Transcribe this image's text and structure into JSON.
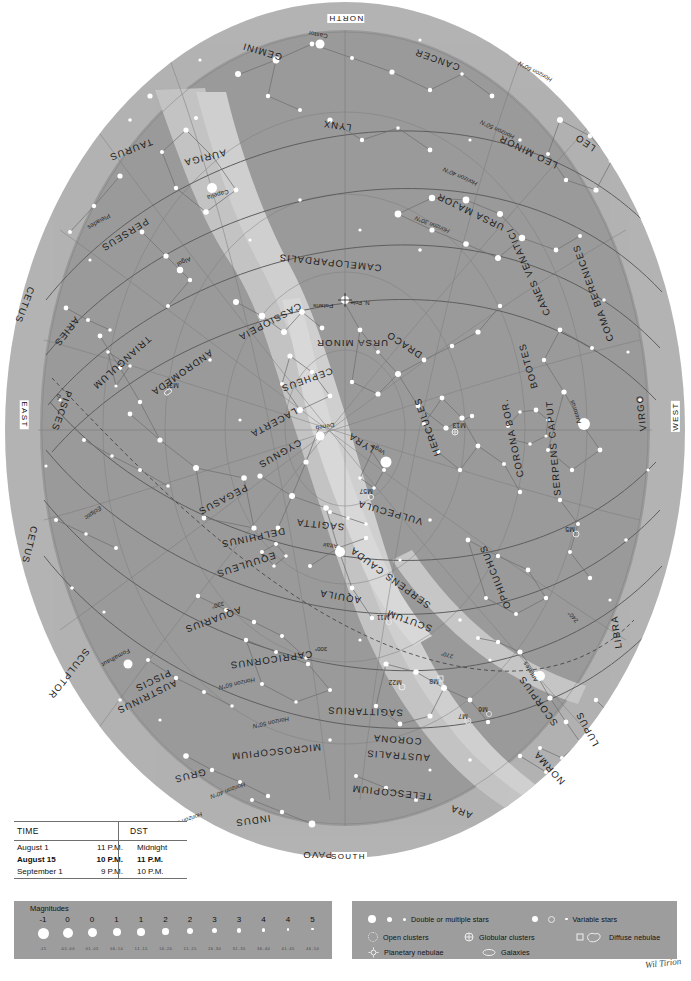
{
  "chart": {
    "cardinals": {
      "north": "NORTH",
      "south": "SOUTH",
      "east": "EAST",
      "west": "WEST"
    },
    "pole_label": "N. Pole",
    "colors": {
      "sky": "#9a9a9a",
      "sky_outer": "#b0b0b0",
      "milky_way": "#c4c4c4",
      "milky_way_bright": "#d2d2d2",
      "page": "#ffffff",
      "star": "#ffffff",
      "line": "#6a6a6a",
      "legend_panel": "#9d9d9d",
      "text": "#1c1c1c"
    },
    "constellations": [
      {
        "name": "GEMINI",
        "x": 262,
        "y": 52,
        "rot": 196,
        "size": "big"
      },
      {
        "name": "CANCER",
        "x": 437,
        "y": 60,
        "rot": 200,
        "size": "big"
      },
      {
        "name": "LYNX",
        "x": 337,
        "y": 126,
        "rot": 188,
        "size": "big"
      },
      {
        "name": "LEO",
        "x": 585,
        "y": 143,
        "rot": 214,
        "size": "big"
      },
      {
        "name": "LEO MINOR",
        "x": 528,
        "y": 152,
        "rot": 206,
        "size": "big"
      },
      {
        "name": "AURIGA",
        "x": 205,
        "y": 158,
        "rot": 166,
        "size": "big"
      },
      {
        "name": "TAURUS",
        "x": 131,
        "y": 150,
        "rot": 159,
        "size": "big"
      },
      {
        "name": "URSA MAJOR",
        "x": 470,
        "y": 212,
        "rot": 206,
        "size": "big"
      },
      {
        "name": "PERSEUS",
        "x": 125,
        "y": 235,
        "rot": 148,
        "size": "big"
      },
      {
        "name": "CAMELOPARDALIS",
        "x": 330,
        "y": 263,
        "rot": 186,
        "size": "big"
      },
      {
        "name": "CANES VENATICI",
        "x": 528,
        "y": 272,
        "rot": 246,
        "size": "big"
      },
      {
        "name": "COMA BERENICES",
        "x": 593,
        "y": 293,
        "rot": 250,
        "size": "big"
      },
      {
        "name": "CETUS",
        "x": 25,
        "y": 305,
        "rot": 111,
        "size": "big"
      },
      {
        "name": "CASSIOPEIA",
        "x": 270,
        "y": 322,
        "rot": 152,
        "size": "big"
      },
      {
        "name": "ARIES",
        "x": 67,
        "y": 332,
        "rot": 128,
        "size": "big"
      },
      {
        "name": "URSA MINOR",
        "x": 352,
        "y": 343,
        "rot": 180,
        "size": "big"
      },
      {
        "name": "DRACO",
        "x": 404,
        "y": 345,
        "rot": 214,
        "size": "big"
      },
      {
        "name": "TRIANGULUM",
        "x": 122,
        "y": 363,
        "rot": 138,
        "size": "big"
      },
      {
        "name": "BOOTES",
        "x": 528,
        "y": 366,
        "rot": 254,
        "size": "big"
      },
      {
        "name": "ANDROMEDA",
        "x": 182,
        "y": 373,
        "rot": 145,
        "size": "big"
      },
      {
        "name": "CEPHEUS",
        "x": 307,
        "y": 380,
        "rot": 160,
        "size": "big"
      },
      {
        "name": "VIRGO",
        "x": 641,
        "y": 413,
        "rot": 264,
        "size": "big"
      },
      {
        "name": "PISCES",
        "x": 62,
        "y": 411,
        "rot": 110,
        "size": "big"
      },
      {
        "name": "LACERTA",
        "x": 274,
        "y": 423,
        "rot": 152,
        "size": "big"
      },
      {
        "name": "HERCULES",
        "x": 427,
        "y": 427,
        "rot": 250,
        "size": "big"
      },
      {
        "name": "LYRA",
        "x": 361,
        "y": 443,
        "rot": 212,
        "size": "big"
      },
      {
        "name": "CYGNUS",
        "x": 280,
        "y": 454,
        "rot": 150,
        "size": "big"
      },
      {
        "name": "CORONA BOR.",
        "x": 512,
        "y": 438,
        "rot": 258,
        "size": "big"
      },
      {
        "name": "SERPENS CAPUT",
        "x": 553,
        "y": 448,
        "rot": 265,
        "size": "big"
      },
      {
        "name": "PEGASUS",
        "x": 223,
        "y": 500,
        "rot": 152,
        "size": "big"
      },
      {
        "name": "VULPECULA",
        "x": 390,
        "y": 513,
        "rot": 196,
        "size": "big"
      },
      {
        "name": "SAGITTA",
        "x": 320,
        "y": 525,
        "rot": 186,
        "size": "big"
      },
      {
        "name": "DELPHINUS",
        "x": 253,
        "y": 538,
        "rot": 168,
        "size": "big"
      },
      {
        "name": "EQUULEUS",
        "x": 246,
        "y": 565,
        "rot": 162,
        "size": "big"
      },
      {
        "name": "SERPENS CAUDA",
        "x": 390,
        "y": 578,
        "rot": 216,
        "size": "big"
      },
      {
        "name": "OPHIUCHUS",
        "x": 495,
        "y": 577,
        "rot": 248,
        "size": "big"
      },
      {
        "name": "AQUILA",
        "x": 340,
        "y": 597,
        "rot": 190,
        "size": "big"
      },
      {
        "name": "SCUTUM",
        "x": 409,
        "y": 621,
        "rot": 200,
        "size": "big"
      },
      {
        "name": "AQUARIUS",
        "x": 213,
        "y": 620,
        "rot": 160,
        "size": "big"
      },
      {
        "name": "LIBRA",
        "x": 616,
        "y": 632,
        "rot": 262,
        "size": "big"
      },
      {
        "name": "CETUS",
        "x": 30,
        "y": 545,
        "rot": 104,
        "size": "big"
      },
      {
        "name": "CAPRICORNUS",
        "x": 271,
        "y": 660,
        "rot": 172,
        "size": "big"
      },
      {
        "name": "SAGITTARIUS",
        "x": 365,
        "y": 712,
        "rot": 182,
        "size": "big"
      },
      {
        "name": "SCORPIUS",
        "x": 538,
        "y": 701,
        "rot": 234,
        "size": "big"
      },
      {
        "name": "SCULPTOR",
        "x": 69,
        "y": 674,
        "rot": 128,
        "size": "big"
      },
      {
        "name": "PISCIS",
        "x": 153,
        "y": 681,
        "rot": 154,
        "size": "big"
      },
      {
        "name": "AUSTRINUS",
        "x": 147,
        "y": 697,
        "rot": 154,
        "size": "big"
      },
      {
        "name": "CORONA",
        "x": 397,
        "y": 740,
        "rot": 184,
        "size": "big"
      },
      {
        "name": "AUSTRALIS",
        "x": 398,
        "y": 756,
        "rot": 184,
        "size": "big"
      },
      {
        "name": "MICROSCOPIUM",
        "x": 276,
        "y": 752,
        "rot": 174,
        "size": "big"
      },
      {
        "name": "LUPUS",
        "x": 587,
        "y": 729,
        "rot": 242,
        "size": "big"
      },
      {
        "name": "GRUS",
        "x": 190,
        "y": 776,
        "rot": 166,
        "size": "big"
      },
      {
        "name": "NORMA",
        "x": 549,
        "y": 768,
        "rot": 228,
        "size": "big"
      },
      {
        "name": "TELESCOPIUM",
        "x": 392,
        "y": 793,
        "rot": 186,
        "size": "big"
      },
      {
        "name": "ARA",
        "x": 461,
        "y": 812,
        "rot": 200,
        "size": "big"
      },
      {
        "name": "INDUS",
        "x": 253,
        "y": 821,
        "rot": 172,
        "size": "big"
      },
      {
        "name": "PAVO",
        "x": 317,
        "y": 855,
        "rot": 180,
        "size": "big"
      }
    ],
    "stars_named": [
      {
        "name": "Castor",
        "x": 318,
        "y": 35,
        "rot": 190
      },
      {
        "name": "Capella",
        "x": 218,
        "y": 195,
        "rot": 164
      },
      {
        "name": "Pleiades",
        "x": 99,
        "y": 222,
        "rot": 150
      },
      {
        "name": "Algol",
        "x": 184,
        "y": 262,
        "rot": 156
      },
      {
        "name": "Polaris",
        "x": 323,
        "y": 306,
        "rot": 180
      },
      {
        "name": "Arcturus",
        "x": 575,
        "y": 412,
        "rot": 252
      },
      {
        "name": "Vega",
        "x": 378,
        "y": 450,
        "rot": 208
      },
      {
        "name": "Deneb",
        "x": 325,
        "y": 427,
        "rot": 170
      },
      {
        "name": "Altair",
        "x": 330,
        "y": 546,
        "rot": 186
      },
      {
        "name": "Fomalhaut",
        "x": 116,
        "y": 658,
        "rot": 152
      },
      {
        "name": "Antares",
        "x": 530,
        "y": 672,
        "rot": 238
      }
    ],
    "deep_sky": [
      {
        "name": "M31",
        "x": 172,
        "y": 385
      },
      {
        "name": "M13",
        "x": 459,
        "y": 425
      },
      {
        "name": "M57",
        "x": 366,
        "y": 491
      },
      {
        "name": "M5",
        "x": 570,
        "y": 529
      },
      {
        "name": "M11",
        "x": 383,
        "y": 617
      },
      {
        "name": "M22",
        "x": 395,
        "y": 682
      },
      {
        "name": "M8",
        "x": 434,
        "y": 681
      },
      {
        "name": "M7",
        "x": 463,
        "y": 716
      },
      {
        "name": "M6",
        "x": 483,
        "y": 709
      }
    ],
    "horizon_lines": [
      {
        "label": "Horizon 60°N",
        "x": 535,
        "y": 72,
        "rot": 208
      },
      {
        "label": "Horizon 50°N",
        "x": 497,
        "y": 130,
        "rot": 205
      },
      {
        "label": "Horizon 40°N",
        "x": 460,
        "y": 177,
        "rot": 204
      },
      {
        "label": "Horizon 30°N",
        "x": 432,
        "y": 225,
        "rot": 202
      },
      {
        "label": "Horizon 60°N",
        "x": 237,
        "y": 684,
        "rot": 167
      },
      {
        "label": "Horizon 50°N",
        "x": 271,
        "y": 723,
        "rot": 168
      },
      {
        "label": "Horizon 40°N",
        "x": 228,
        "y": 791,
        "rot": 160
      },
      {
        "label": "Horizon 30°N",
        "x": 185,
        "y": 821,
        "rot": 159
      }
    ],
    "ra_labels": [
      {
        "label": "0°",
        "x": 58,
        "y": 397,
        "rot": 120
      },
      {
        "label": "330°",
        "x": 218,
        "y": 605,
        "rot": 166
      },
      {
        "label": "300°",
        "x": 321,
        "y": 649,
        "rot": 180
      },
      {
        "label": "270°",
        "x": 447,
        "y": 655,
        "rot": 196
      },
      {
        "label": "240°",
        "x": 573,
        "y": 617,
        "rot": 230
      }
    ],
    "ecliptic_label": {
      "label": "Ecliptic",
      "x": 93,
      "y": 513,
      "rot": 146
    }
  },
  "time_table": {
    "header": {
      "time": "TIME",
      "dst": "DST"
    },
    "rows": [
      {
        "date": "August 1",
        "time": "11 P.M.",
        "dst": "Midnight",
        "bold": false
      },
      {
        "date": "August 15",
        "time": "10 P.M.",
        "dst": "11 P.M.",
        "bold": true
      },
      {
        "date": "September 1",
        "time": "9 P.M.",
        "dst": "10 P.M.",
        "bold": false
      }
    ]
  },
  "magnitude_legend": {
    "title": "Magnitudes",
    "entries": [
      {
        "label": "-1",
        "range": "-1.5",
        "size": 11
      },
      {
        "label": "0",
        "range": "-0.5 - 0.0",
        "size": 10
      },
      {
        "label": "0",
        "range": "0.1 - 0.5",
        "size": 9
      },
      {
        "label": "1",
        "range": "0.6 - 1.0",
        "size": 8
      },
      {
        "label": "1",
        "range": "1.1 - 1.5",
        "size": 7.5
      },
      {
        "label": "2",
        "range": "1.6 - 2.0",
        "size": 6.5
      },
      {
        "label": "2",
        "range": "2.1 - 2.5",
        "size": 6
      },
      {
        "label": "3",
        "range": "2.6 - 3.0",
        "size": 5
      },
      {
        "label": "3",
        "range": "3.1 - 3.5",
        "size": 4.5
      },
      {
        "label": "4",
        "range": "3.6 - 4.0",
        "size": 3.5
      },
      {
        "label": "4",
        "range": "4.1 - 4.5",
        "size": 2.8
      },
      {
        "label": "5",
        "range": "4.6 - 5.0",
        "size": 2.2
      }
    ]
  },
  "symbol_legend": {
    "items": [
      {
        "label": "Double or multiple stars",
        "icon": "double-star-icon"
      },
      {
        "label": "Variable stars",
        "icon": "variable-star-icon"
      },
      {
        "label": "Open clusters",
        "icon": "open-cluster-icon"
      },
      {
        "label": "Globular clusters",
        "icon": "globular-cluster-icon"
      },
      {
        "label": "Diffuse nebulae",
        "icon": "diffuse-nebula-icon"
      },
      {
        "label": "Planetary nebulae",
        "icon": "planetary-nebula-icon"
      },
      {
        "label": "Galaxies",
        "icon": "galaxy-icon"
      }
    ]
  },
  "signature": {
    "text": "Wil Tirion"
  }
}
